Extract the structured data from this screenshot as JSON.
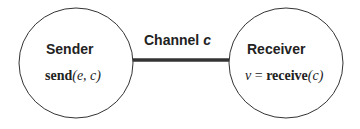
{
  "diagram": {
    "sender": {
      "title": "Sender",
      "op_name": "send",
      "op_args": "(e, c)"
    },
    "receiver": {
      "title": "Receiver",
      "result_var": "v",
      "equals": " = ",
      "op_name": "receive",
      "op_args": "(c)"
    },
    "channel": {
      "label_prefix": "Channel ",
      "label_var": "c"
    },
    "colors": {
      "stroke": "#333333",
      "channel_line": "#333333",
      "text": "#222222"
    }
  }
}
